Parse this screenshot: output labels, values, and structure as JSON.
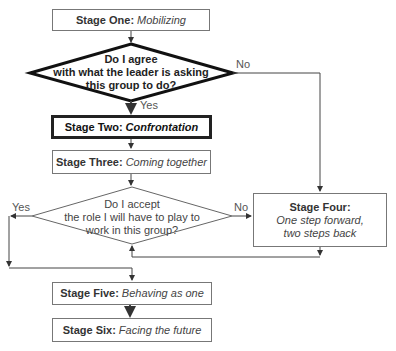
{
  "diagram": {
    "stages": {
      "one": {
        "title": "Stage One:",
        "subtitle": "Mobilizing"
      },
      "two": {
        "title": "Stage Two:",
        "subtitle": "Confrontation"
      },
      "three": {
        "title": "Stage Three:",
        "subtitle": "Coming together"
      },
      "four": {
        "title": "Stage Four:",
        "subtitle_line1": "One step forward,",
        "subtitle_line2": "two steps back"
      },
      "five": {
        "title": "Stage Five:",
        "subtitle": "Behaving as one"
      },
      "six": {
        "title": "Stage Six:",
        "subtitle": "Facing the future"
      }
    },
    "decisions": {
      "agree": {
        "line1": "Do I agree",
        "line2": "with what the leader is asking",
        "line3": "this group to do?",
        "yes_label": "Yes",
        "no_label": "No"
      },
      "accept": {
        "line1": "Do I accept",
        "line2": "the role I will have to play to",
        "line3": "work in this group?",
        "yes_label": "Yes",
        "no_label": "No"
      }
    },
    "edges": [
      {
        "from": "Stage One",
        "to": "Decision: agree"
      },
      {
        "from": "Decision: agree",
        "to": "Stage Two",
        "label": "Yes"
      },
      {
        "from": "Decision: agree",
        "to": "Stage Four",
        "label": "No"
      },
      {
        "from": "Stage Two",
        "to": "Stage Three"
      },
      {
        "from": "Stage Three",
        "to": "Decision: accept"
      },
      {
        "from": "Decision: accept",
        "to": "Stage Five",
        "label": "Yes"
      },
      {
        "from": "Decision: accept",
        "to": "Stage Four",
        "label": "No"
      },
      {
        "from": "Stage Four",
        "to": "Decision: accept"
      },
      {
        "from": "Stage Five",
        "to": "Stage Six"
      }
    ]
  }
}
